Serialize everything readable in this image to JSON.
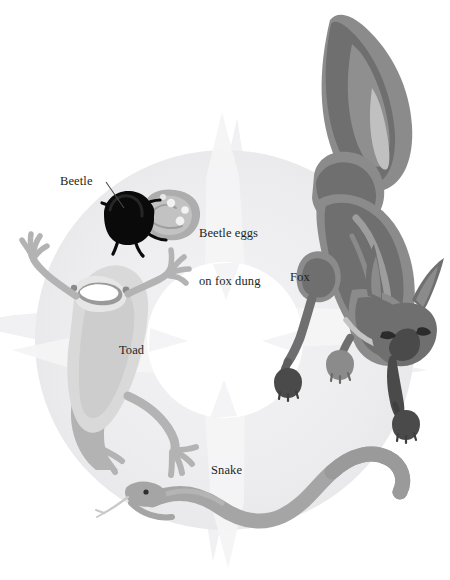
{
  "diagram": {
    "type": "cycle-diagram",
    "direction": "clockwise",
    "canvas": {
      "width": 450,
      "height": 580,
      "background": "#ffffff"
    },
    "palette": {
      "ring_fill": "#ededef",
      "ring_edge": "#e4e4e6",
      "arrow_fill": "#f2f2f4",
      "center_fill": "#ffffff",
      "text": "#231f20",
      "beetle_black": "#080808",
      "dung_gray": "#a9a9a9",
      "dung_light": "#c9c9c9",
      "egg_white": "#f4f4f4",
      "toad_light": "#dcdcdc",
      "toad_mid": "#b0b0b0",
      "toad_dark": "#9a9a9a",
      "snake_mid": "#a3a3a3",
      "snake_dark": "#8e8e8e",
      "fox_mid": "#8f8f8f",
      "fox_dark": "#6d6d6d",
      "fox_darkest": "#4a4a4a",
      "fox_light": "#b6b6b6"
    },
    "center": {
      "cx": 225,
      "cy": 340,
      "inner_radius": 78,
      "outer_radius": 190
    }
  },
  "labels": {
    "beetle": "Beetle",
    "beetle_eggs_line1": "Beetle eggs",
    "beetle_eggs_line2": "on fox dung",
    "fox": "Fox",
    "toad": "Toad",
    "snake": "Snake"
  },
  "stages": [
    {
      "id": "beetle",
      "label": "Beetle",
      "quadrant": "top-left",
      "icon": "beetle-icon"
    },
    {
      "id": "fox",
      "label": "Fox",
      "quadrant": "top-right",
      "icon": "fox-icon"
    },
    {
      "id": "snake",
      "label": "Snake",
      "quadrant": "bottom-right",
      "icon": "snake-icon"
    },
    {
      "id": "toad",
      "label": "Toad",
      "quadrant": "bottom-left",
      "icon": "toad-icon"
    }
  ],
  "annotations": [
    {
      "id": "beetle-leader",
      "label": "Beetle",
      "has_leader_line": true
    },
    {
      "id": "dung-note",
      "label": "Beetle eggs on fox dung",
      "has_leader_line": false
    }
  ]
}
